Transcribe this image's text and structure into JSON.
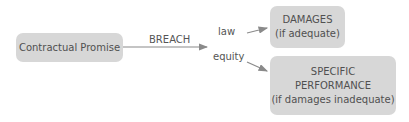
{
  "diagram": {
    "source": {
      "label": "Contractual Promise"
    },
    "edge_main": {
      "label": "BREACH"
    },
    "branches": [
      {
        "edge_label": "law",
        "target_lines": [
          "DAMAGES",
          "(if adequate)"
        ]
      },
      {
        "edge_label": "equity",
        "target_lines": [
          "SPECIFIC",
          "PERFORMANCE",
          "(if damages inadequate)"
        ]
      }
    ],
    "colors": {
      "box_fill": "#d7d7d7",
      "arrow": "#8a8a8a",
      "text": "#555555"
    }
  }
}
